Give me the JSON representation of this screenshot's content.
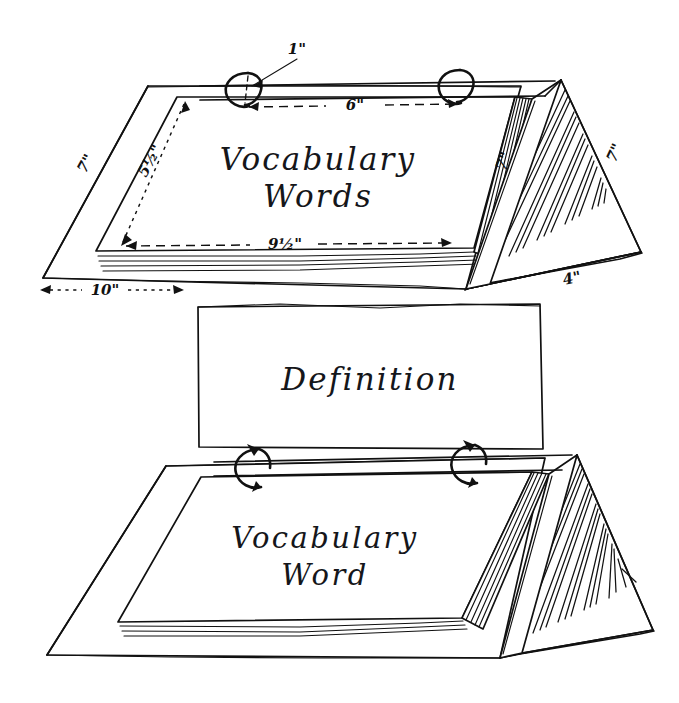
{
  "diagram": {
    "style": "hand-drawn pen sketch",
    "background_color": "#ffffff",
    "ink_color": "#111111"
  },
  "top_unit": {
    "name": "open-tent-binder-with-dimensions",
    "card_text_line1": "Vocabulary",
    "card_text_line2": "Words",
    "dimensions": [
      {
        "id": "ring-diameter",
        "label": "1\"",
        "kind": "leader-arrow",
        "target": "binder-ring"
      },
      {
        "id": "ring-spacing",
        "label": "6\"",
        "kind": "dashed-span",
        "target": "distance-between-rings"
      },
      {
        "id": "cover-left-height",
        "label": "7\"",
        "kind": "edge",
        "target": "cover-left-slant-edge"
      },
      {
        "id": "page-height",
        "label": "5½\"",
        "base": "5",
        "numerator": "1",
        "denominator": "2",
        "suffix": "\"",
        "kind": "dotted-arrow",
        "target": "page-vertical-height"
      },
      {
        "id": "page-width",
        "label": "9½\"",
        "base": "9",
        "numerator": "1",
        "denominator": "2",
        "suffix": "\"",
        "kind": "dashed-arrow",
        "target": "page-bottom-width"
      },
      {
        "id": "base-width",
        "label": "10\"",
        "kind": "dotted-arrow",
        "target": "cover-base-front-width"
      },
      {
        "id": "spine-slant-left",
        "label": "7\"",
        "kind": "edge",
        "target": "tent-front-slant-edge"
      },
      {
        "id": "tent-slant-right",
        "label": "7\"",
        "kind": "edge",
        "target": "tent-back-slant-edge"
      },
      {
        "id": "tent-base-depth",
        "label": "4\"",
        "kind": "edge",
        "target": "tent-base-edge"
      }
    ]
  },
  "middle_card": {
    "name": "definition-card",
    "text": "Definition"
  },
  "bottom_unit": {
    "name": "closed-tent-binder-flipping",
    "card_text_line1": "Vocabulary",
    "card_text_line2": "Word",
    "ring_arrows": "flip-rotation-arrows"
  }
}
